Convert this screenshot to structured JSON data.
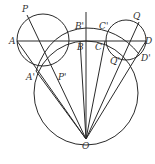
{
  "diagram": {
    "type": "geometry",
    "colors": {
      "line": "#2a2a2a",
      "label": "#333333",
      "background": "#ffffff"
    },
    "labels": {
      "P": "P",
      "A": "A",
      "A_prime": "A'",
      "P_prime": "P'",
      "B": "B",
      "B_prime": "B'",
      "C": "C",
      "C_prime": "C'",
      "Q": "Q",
      "D": "D",
      "D_prime": "D'",
      "Q_prime": "Q'",
      "O": "O"
    },
    "circles": [
      {
        "name": "left-circle",
        "cx": 43,
        "cy": 40,
        "r": 26
      },
      {
        "name": "right-circle",
        "cx": 126,
        "cy": 40,
        "r": 20
      },
      {
        "name": "large-circle",
        "cx": 86,
        "cy": 93,
        "r": 52
      }
    ],
    "points": {
      "P": [
        27,
        15
      ],
      "A": [
        17,
        41
      ],
      "A_prime": [
        36,
        71
      ],
      "P_prime": [
        57,
        70
      ],
      "B": [
        86,
        41
      ],
      "B_prime": [
        86,
        28
      ],
      "C": [
        105,
        41
      ],
      "C_prime": [
        108,
        27
      ],
      "Q": [
        139,
        22
      ],
      "D": [
        146,
        41
      ],
      "D_prime": [
        139,
        54
      ],
      "Q_prime": [
        117,
        56
      ],
      "O": [
        86,
        139
      ]
    }
  }
}
